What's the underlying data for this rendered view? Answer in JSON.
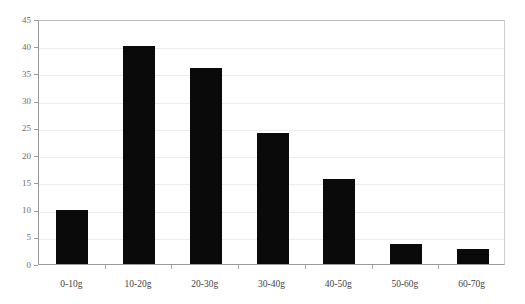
{
  "chart_data": {
    "type": "bar",
    "title": "",
    "title_fragment_note": "cut off at top edge",
    "xlabel": "",
    "ylabel": "",
    "categories": [
      "0-10g",
      "10-20g",
      "20-30g",
      "30-40g",
      "40-50g",
      "50-60g",
      "60-70g"
    ],
    "values": [
      10,
      40,
      36,
      24,
      15.6,
      3.7,
      2.8
    ],
    "ylim": [
      0,
      45
    ],
    "ytick_labels": [
      "0",
      "5",
      "10",
      "15",
      "20",
      "25",
      "30",
      "35",
      "40",
      "45"
    ],
    "ytick_values": [
      0,
      5,
      10,
      15,
      20,
      25,
      30,
      35,
      40,
      45
    ],
    "grid": true,
    "legend": "none",
    "bar_color": "#0a0a0a",
    "background_color": "#ffffff",
    "gridline_color": "#ececec",
    "axis_color": "#9a9a9a"
  }
}
